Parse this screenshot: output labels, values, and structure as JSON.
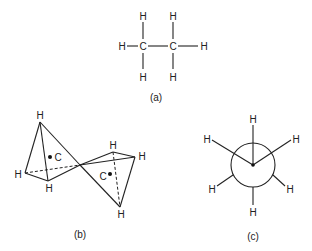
{
  "figure": {
    "panel_a": {
      "caption": "(a)",
      "description": "Ethane structural formula",
      "atoms": {
        "c1": "C",
        "c2": "C",
        "h_top_left": "H",
        "h_top_right": "H",
        "h_left": "H",
        "h_right": "H",
        "h_bottom_left": "H",
        "h_bottom_right": "H"
      }
    },
    "panel_b": {
      "caption": "(b)",
      "description": "Ethane as two joined tetrahedra",
      "atoms": {
        "h_apex": "H",
        "h_left": "H",
        "h_bottom_left": "H",
        "c_left": "C",
        "h_top_right": "H",
        "h_right": "H",
        "h_bottom_right": "H",
        "c_right": "C"
      }
    },
    "panel_c": {
      "caption": "(c)",
      "description": "Newman projection of ethane (staggered)",
      "atoms": {
        "h_top": "H",
        "h_upper_left": "H",
        "h_upper_right": "H",
        "h_lower_left": "H",
        "h_lower_right": "H",
        "h_bottom": "H"
      }
    }
  }
}
